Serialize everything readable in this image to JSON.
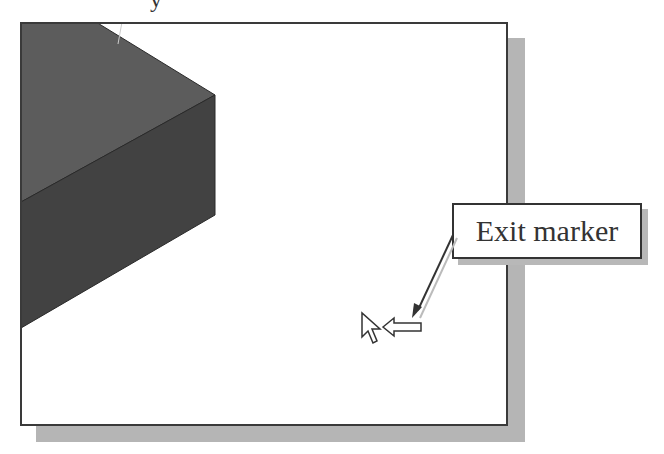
{
  "header_fragment": "y",
  "viewport": {
    "background": "#ffffff",
    "border_color": "#3a3a3a",
    "shadow_color": "#b5b5b5"
  },
  "model": {
    "top_face_color": "#5a5a5a",
    "front_face_color": "#404040"
  },
  "callout": {
    "label": "Exit marker"
  },
  "cursor": {
    "type": "arrow-pointer",
    "indicator": "hollow-left-arrow"
  }
}
